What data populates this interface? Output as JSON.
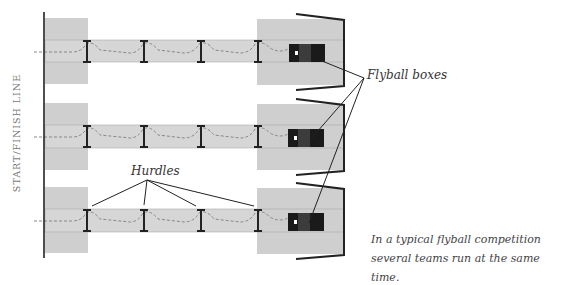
{
  "labels": {
    "start_finish_line": "START/FINISH LINE",
    "flyball_boxes": "Flyball boxes",
    "hurdles": "Hurdles",
    "caption_line1": "In a typical flyball competition",
    "caption_line2": "several teams run at the same time."
  },
  "lanes": [
    {
      "id": 1,
      "y_center": 51,
      "hurdles": 4
    },
    {
      "id": 2,
      "y_center": 136,
      "hurdles": 4
    },
    {
      "id": 3,
      "y_center": 220,
      "hurdles": 4
    }
  ],
  "colors": {
    "box_fill": "#cfcfcf",
    "runway_fill": "#d6d6d6",
    "line": "#222222",
    "dash": "#888888",
    "flyball_box": "#1a1a1a",
    "flyball_box_mid": "#3c3c3c"
  }
}
